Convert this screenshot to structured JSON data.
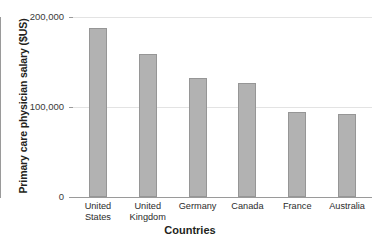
{
  "chart_data": {
    "type": "bar",
    "title": "",
    "xlabel": "Countries",
    "ylabel": "Primary care physician salary ($US)",
    "categories": [
      "United States",
      "United Kingdom",
      "Germany",
      "Canada",
      "France",
      "Australia"
    ],
    "category_lines": [
      [
        "United",
        "States"
      ],
      [
        "United",
        "Kingdom"
      ],
      [
        "Germany"
      ],
      [
        "Canada"
      ],
      [
        "France"
      ],
      [
        "Australia"
      ]
    ],
    "values": [
      188000,
      159000,
      132000,
      127000,
      95000,
      92000
    ],
    "ylim": [
      0,
      200000
    ],
    "yticks": [
      0,
      100000,
      200000
    ],
    "ytick_labels": [
      "0",
      "100,000",
      "200,000"
    ],
    "grid": "horizontal",
    "legend": "none",
    "bar_color": "#b2b2b2",
    "bar_border_color": "#969696",
    "gridline_color": "#e3e3e3",
    "axis_color": "#9a9a9a",
    "text_color": "#231f20"
  }
}
